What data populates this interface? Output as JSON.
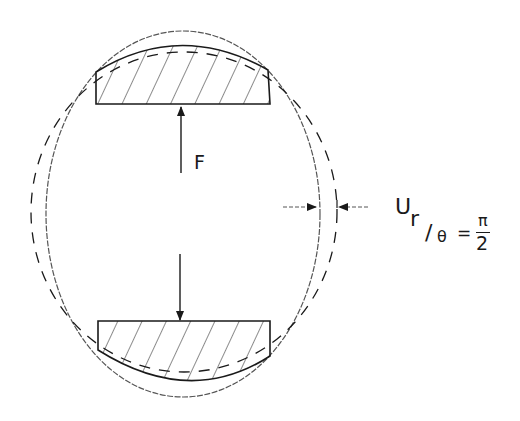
{
  "figure": {
    "force_label": "F",
    "displacement": {
      "symbol": "U",
      "subscript_r": "r",
      "subscript_slash": "/",
      "subscript_theta": "θ",
      "equals": "=",
      "numerator": "π",
      "denominator": "2"
    },
    "colors": {
      "ink": "#1a1a1a",
      "light_ink": "#555555",
      "background": "#ffffff"
    }
  }
}
